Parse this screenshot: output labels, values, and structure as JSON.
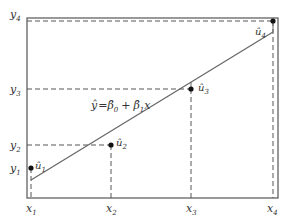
{
  "diagram": {
    "equation": {
      "lhs": "ŷ",
      "eq": "=",
      "b0": "β̂",
      "b0_sub": "0",
      "plus": "+",
      "b1": "β̂",
      "b1_sub": "1",
      "x": "x"
    },
    "x_labels": [
      {
        "base": "x",
        "sub": "1"
      },
      {
        "base": "x",
        "sub": "2"
      },
      {
        "base": "x",
        "sub": "3"
      },
      {
        "base": "x",
        "sub": "4"
      }
    ],
    "y_labels": [
      {
        "base": "y",
        "sub": "1"
      },
      {
        "base": "y",
        "sub": "2"
      },
      {
        "base": "y",
        "sub": "3"
      },
      {
        "base": "y",
        "sub": "4"
      }
    ],
    "residual_labels": [
      {
        "base": "û",
        "sub": "1"
      },
      {
        "base": "û",
        "sub": "2"
      },
      {
        "base": "û",
        "sub": "3"
      },
      {
        "base": "û",
        "sub": "4"
      }
    ],
    "colors": {
      "line": "#555555",
      "frame": "#444444",
      "dash": "#555555",
      "point": "#111111"
    }
  }
}
